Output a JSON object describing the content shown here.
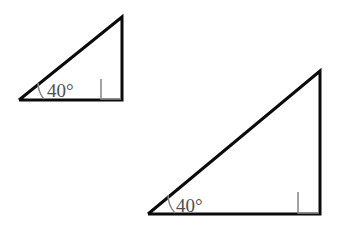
{
  "figure": {
    "background_color": "#ffffff",
    "stroke_color": "#0b0b0b",
    "mark_color": "#8d8d8d",
    "label_color": "#4e4e4e",
    "shapes": [
      {
        "name": "small-triangle",
        "angle_label": "40°",
        "right_angle": "90°",
        "vertices": {
          "bottom_left": [
            19,
            100
          ],
          "apex": [
            122,
            17
          ],
          "bottom_right": [
            122,
            100
          ]
        },
        "edges": "19,100 122,17 122,100 19,100",
        "right_angle_mark": "101,79 101,99 121,99",
        "angle_arc": "M 44,99 A 25,25 0 0 1 38,83",
        "label_x": 47,
        "label_y": 97
      },
      {
        "name": "large-triangle",
        "angle_label": "40°",
        "right_angle": "90°",
        "vertices": {
          "bottom_left": [
            148,
            214
          ],
          "apex": [
            320,
            71
          ],
          "bottom_right": [
            320,
            214
          ]
        },
        "edges": "148,214 320,71 320,214 148,214",
        "right_angle_mark": "298,192 298,213 319,213",
        "angle_arc": "M 175,213 A 27,27 0 0 1 168,195",
        "label_x": 176,
        "label_y": 212
      }
    ]
  },
  "labels": {
    "small_angle": "40°",
    "large_angle": "40°"
  }
}
